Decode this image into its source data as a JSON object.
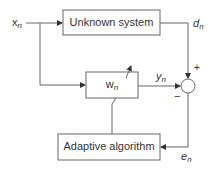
{
  "diagram": {
    "type": "adaptive-filter-system-identification",
    "colors": {
      "line": "#555555",
      "text": "#333333",
      "background": "#ffffff"
    },
    "blocks": {
      "unknown_system": {
        "label": "Unknown system"
      },
      "filter": {
        "label": "w",
        "subscript": "n"
      },
      "adaptive_algorithm": {
        "label": "Adaptive algorithm"
      }
    },
    "signals": {
      "input": {
        "label": "x",
        "subscript": "n"
      },
      "desired": {
        "label": "d",
        "subscript": "n"
      },
      "output": {
        "label": "y",
        "subscript": "n"
      },
      "error": {
        "label": "e",
        "subscript": "n"
      }
    },
    "summing_junction": {
      "plus": "+",
      "minus": "−"
    }
  }
}
